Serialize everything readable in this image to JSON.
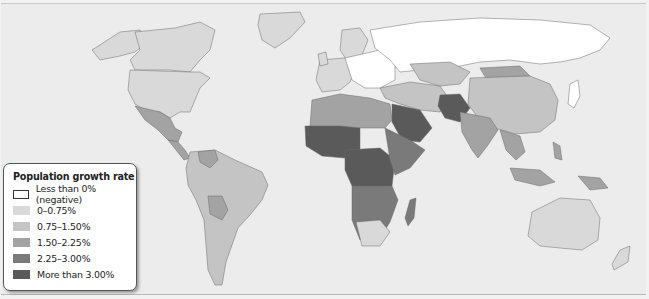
{
  "legend": {
    "title": "Population growth rate",
    "items": [
      {
        "label": "Less than 0% (negative)",
        "color": "#ffffff",
        "border": "#333333"
      },
      {
        "label": "0–0.75%",
        "color": "#d9d9d9",
        "border": "#d9d9d9"
      },
      {
        "label": "0.75–1.50%",
        "color": "#c4c4c4",
        "border": "#c4c4c4"
      },
      {
        "label": "1.50–2.25%",
        "color": "#a3a3a3",
        "border": "#a3a3a3"
      },
      {
        "label": "2.25–3.00%",
        "color": "#7a7a7a",
        "border": "#7a7a7a"
      },
      {
        "label": "More than 3.00%",
        "color": "#5a5a5a",
        "border": "#5a5a5a"
      }
    ]
  },
  "colors": {
    "ocean": "#ececec",
    "negative": "#ffffff",
    "c1": "#d9d9d9",
    "c2": "#c4c4c4",
    "c3": "#a3a3a3",
    "c4": "#7a7a7a",
    "c5": "#5a5a5a",
    "border": "#6a6a6a"
  }
}
